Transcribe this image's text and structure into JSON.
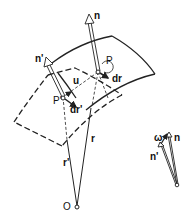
{
  "diagram": {
    "labels": {
      "n": "n",
      "n_prime": "n'",
      "P": "P",
      "P_prime": "P'",
      "u": "u",
      "dr": "dr",
      "dr_prime": "dr'",
      "r": "r",
      "r_prime": "r'",
      "O": "O",
      "omega": "ω",
      "inset_n": "n",
      "inset_n_prime": "n'"
    },
    "colors": {
      "stroke": "#222222",
      "background": "#ffffff"
    }
  }
}
